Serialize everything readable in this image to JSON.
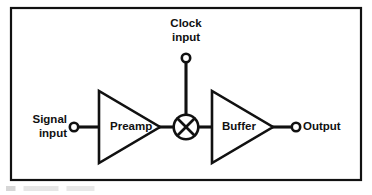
{
  "figure": {
    "type": "block-diagram",
    "line_color": "#111111",
    "background_color": "#ffffff"
  },
  "frame": {
    "name": "diagram-border",
    "x": 11,
    "y": 8,
    "width": 350,
    "height": 172
  },
  "terminals": [
    {
      "id": "signal-input",
      "label_line1": "Signal",
      "label_line2": "input",
      "cx": 74,
      "cy": 127,
      "r": 4.2
    },
    {
      "id": "clock-input",
      "label_line1": "Clock",
      "label_line2": "input",
      "cx": 186,
      "cy": 58,
      "r": 4.2
    },
    {
      "id": "output",
      "label_line1": "Output",
      "label_line2": "",
      "cx": 296,
      "cy": 127,
      "r": 4.2
    }
  ],
  "blocks": [
    {
      "id": "preamp",
      "label": "Preamp",
      "shape": "triangle-amplifier",
      "x1": 99,
      "y1": 91,
      "x2": 99,
      "y2": 163,
      "tipx": 160,
      "tipy": 127
    },
    {
      "id": "buffer",
      "label": "Buffer",
      "shape": "triangle-amplifier",
      "x1": 212,
      "y1": 91,
      "x2": 212,
      "y2": 163,
      "tipx": 273,
      "tipy": 127
    }
  ],
  "mixer": {
    "id": "mixer",
    "symbol": "circle-with-x",
    "cx": 186,
    "cy": 127,
    "r": 12.5
  },
  "wires": [
    {
      "id": "wire-signal-to-preamp",
      "x1": 78,
      "y1": 127,
      "x2": 99,
      "y2": 127
    },
    {
      "id": "wire-preamp-to-mixer",
      "x1": 160,
      "y1": 127,
      "x2": 173.5,
      "y2": 127
    },
    {
      "id": "wire-clock-to-mixer",
      "x1": 186,
      "y1": 62,
      "x2": 186,
      "y2": 114.5
    },
    {
      "id": "wire-mixer-to-buffer",
      "x1": 198.5,
      "y1": 127,
      "x2": 212,
      "y2": 127
    },
    {
      "id": "wire-buffer-to-output",
      "x1": 273,
      "y1": 127,
      "x2": 292,
      "y2": 127
    }
  ]
}
